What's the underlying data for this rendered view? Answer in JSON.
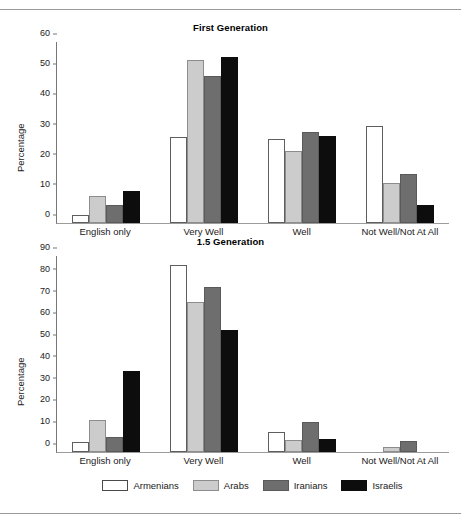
{
  "figure": {
    "background": "#ffffff",
    "rule_color": "#9a9a9a"
  },
  "series_colors": {
    "Armenians": "#ffffff",
    "Arabs": "#cccccc",
    "Iranians": "#6e6e6e",
    "Israelis": "#0d0d0d"
  },
  "legend": {
    "position": "bottom-center",
    "items": [
      {
        "label": "Armenians",
        "key": "armenians",
        "color": "#ffffff"
      },
      {
        "label": "Arabs",
        "key": "arabs",
        "color": "#cccccc"
      },
      {
        "label": "Iranians",
        "key": "iranians",
        "color": "#6e6e6e"
      },
      {
        "label": "Israelis",
        "key": "israelis",
        "color": "#0d0d0d"
      }
    ]
  },
  "chart_data": [
    {
      "id": "first-generation",
      "type": "bar",
      "title": "First Generation",
      "xlabel": "",
      "ylabel": "Percentage",
      "ylim": [
        0,
        60
      ],
      "yticks": [
        0,
        10,
        20,
        30,
        40,
        50,
        60
      ],
      "grid": false,
      "legend_position": "bottom-center",
      "categories": [
        "English only",
        "Very Well",
        "Well",
        "Not Well/Not At All"
      ],
      "series": [
        {
          "name": "Armenians",
          "values": [
            2.6,
            28.4,
            27.8,
            32.0
          ]
        },
        {
          "name": "Arabs",
          "values": [
            9.0,
            54.2,
            23.8,
            13.1
          ]
        },
        {
          "name": "Iranians",
          "values": [
            5.9,
            48.7,
            30.3,
            16.3
          ]
        },
        {
          "name": "Israelis",
          "values": [
            10.7,
            55.1,
            28.9,
            6.0
          ]
        }
      ]
    },
    {
      "id": "one-point-five-generation",
      "type": "bar",
      "title": "1.5 Generation",
      "xlabel": "",
      "ylabel": "Percentage",
      "ylim": [
        0,
        90
      ],
      "yticks": [
        0,
        10,
        20,
        30,
        40,
        50,
        60,
        70,
        80,
        90
      ],
      "grid": false,
      "legend_position": "bottom-center",
      "categories": [
        "English only",
        "Very Well",
        "Well",
        "Not Well/Not At All"
      ],
      "series": [
        {
          "name": "Armenians",
          "values": [
            4.4,
            86.1,
            9.4,
            0.0
          ]
        },
        {
          "name": "Arabs",
          "values": [
            14.9,
            68.9,
            5.3,
            2.1
          ]
        },
        {
          "name": "Iranians",
          "values": [
            7.0,
            76.0,
            13.7,
            4.9
          ]
        },
        {
          "name": "Israelis",
          "values": [
            37.0,
            56.1,
            6.0,
            0.0
          ]
        }
      ]
    }
  ]
}
